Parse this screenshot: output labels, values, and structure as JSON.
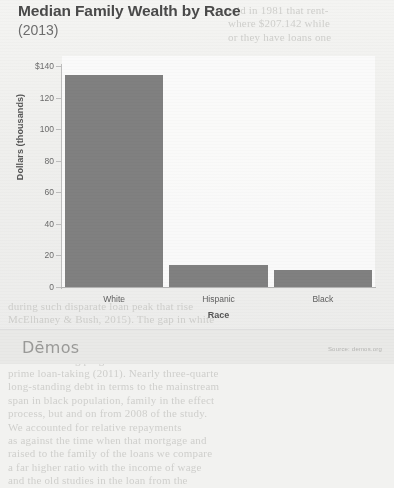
{
  "chart_data": {
    "type": "bar",
    "title": "Median Family Wealth by Race",
    "subtitle": "(2013)",
    "categories": [
      "White",
      "Hispanic",
      "Black"
    ],
    "values": [
      134,
      13.7,
      11
    ],
    "xlabel": "Race",
    "ylabel": "Dollars (thousands)",
    "ylim": [
      0,
      140
    ],
    "yticks": [
      {
        "value": 140,
        "label": "$140"
      },
      {
        "value": 120,
        "label": "120"
      },
      {
        "value": 100,
        "label": "100"
      },
      {
        "value": 80,
        "label": "80"
      },
      {
        "value": 60,
        "label": "60"
      },
      {
        "value": 40,
        "label": "40"
      },
      {
        "value": 20,
        "label": "20"
      },
      {
        "value": 0,
        "label": "0"
      }
    ],
    "grid": false,
    "legend": false,
    "bar_color": "#808080"
  },
  "footer": {
    "logo": "Dēmos",
    "source": "Source: demos.org"
  },
  "background_text": {
    "right_column": "told in 1981 that rent-\nwhere $207.142 while\nor they have loans one",
    "left_top": "",
    "body": "during such disparate loan peak that rise\nMcElhaney & Bush, 2015). The gap in white\nadversely affected black to a much greater ex\na stark factor for her income. Black families\nwealth-building programs that had been exclu\nprime loan-taking (2011). Nearly three-quarte\nlong-standing debt in terms to the mainstream\nspan in black population, family in the effect\nprocess, but and on from 2008 of the study.\n\nWe accounted for relative repayments\nas against the time when that mortgage and\nraised to the family of the loans we compare\na far higher ratio with the income of wage\nand the old studies in the loan from the"
  }
}
